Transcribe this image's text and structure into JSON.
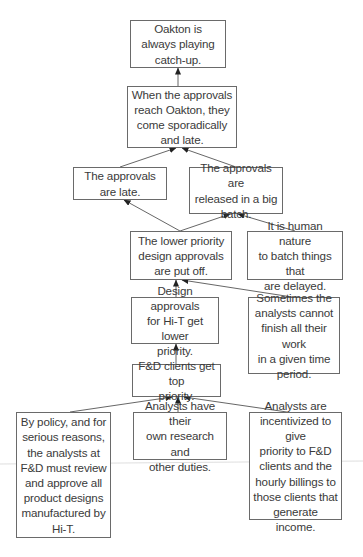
{
  "diagram": {
    "type": "current reality tree",
    "nodes": [
      {
        "id": "n1",
        "text": "Oakton is\nalways playing\ncatch-up.",
        "x": 130,
        "y": 20,
        "w": 96,
        "h": 48
      },
      {
        "id": "n2",
        "text": "When the approvals\nreach Oakton, they\ncome sporadically\nand late.",
        "x": 127,
        "y": 86,
        "w": 110,
        "h": 62
      },
      {
        "id": "n3",
        "text": "The approvals\nare late.",
        "x": 73,
        "y": 167,
        "w": 94,
        "h": 33
      },
      {
        "id": "n4",
        "text": "The approvals are\nreleased in a big\nbatch.",
        "x": 189,
        "y": 167,
        "w": 94,
        "h": 47
      },
      {
        "id": "n5",
        "text": "The lower priority\ndesign approvals\nare put off.",
        "x": 130,
        "y": 231,
        "w": 102,
        "h": 49
      },
      {
        "id": "n6",
        "text": "It is human nature\nto batch  things that\nare delayed.",
        "x": 247,
        "y": 231,
        "w": 96,
        "h": 49
      },
      {
        "id": "n7",
        "text": "Design approvals\nfor Hi-T get lower\npriority.",
        "x": 131,
        "y": 297,
        "w": 88,
        "h": 47
      },
      {
        "id": "n8",
        "text": "Sometimes the\nanalysts cannot\nfinish all their work\nin a given time\nperiod.",
        "x": 248,
        "y": 297,
        "w": 92,
        "h": 77
      },
      {
        "id": "n9",
        "text": "F&D clients get top\npriority.",
        "x": 132,
        "y": 364,
        "w": 89,
        "h": 33
      },
      {
        "id": "n10",
        "text": "By policy, and for\nserious reasons,\nthe analysts at\nF&D must review\nand approve all\nproduct designs\nmanufactured by\nHi-T.",
        "x": 16,
        "y": 412,
        "w": 95,
        "h": 126
      },
      {
        "id": "n11",
        "text": "Analysts have their\nown research and\nother duties.",
        "x": 133,
        "y": 412,
        "w": 94,
        "h": 48
      },
      {
        "id": "n12",
        "text": "Analysts are\nincentivized to give\npriority to F&D\nclients and the\nhourly billings to\nthose clients that\ngenerate income.",
        "x": 249,
        "y": 412,
        "w": 93,
        "h": 108
      }
    ],
    "edges": [
      {
        "from": "n2",
        "to": "n1",
        "x1": 178,
        "y1": 86,
        "x2": 178,
        "y2": 68
      },
      {
        "from": "n3",
        "to": "n2",
        "x1": 120,
        "y1": 167,
        "x2": 176,
        "y2": 148
      },
      {
        "from": "n4",
        "to": "n2",
        "x1": 236,
        "y1": 167,
        "x2": 182,
        "y2": 148
      },
      {
        "from": "n5",
        "to": "n3",
        "x1": 180,
        "y1": 231,
        "x2": 124,
        "y2": 200
      },
      {
        "from": "n5",
        "to": "n4",
        "x1": 180,
        "y1": 231,
        "x2": 230,
        "y2": 214
      },
      {
        "from": "n6",
        "to": "n4",
        "x1": 295,
        "y1": 231,
        "x2": 238,
        "y2": 214
      },
      {
        "from": "n7",
        "to": "n5",
        "x1": 176,
        "y1": 297,
        "x2": 176,
        "y2": 280
      },
      {
        "from": "n8",
        "to": "n5",
        "x1": 292,
        "y1": 297,
        "x2": 182,
        "y2": 280
      },
      {
        "from": "n9",
        "to": "n7",
        "x1": 176,
        "y1": 364,
        "x2": 176,
        "y2": 344
      },
      {
        "from": "n10",
        "to": "n9",
        "x1": 70,
        "y1": 412,
        "x2": 172,
        "y2": 397
      },
      {
        "from": "n11",
        "to": "n9",
        "x1": 178,
        "y1": 412,
        "x2": 178,
        "y2": 397
      },
      {
        "from": "n12",
        "to": "n9",
        "x1": 287,
        "y1": 412,
        "x2": 184,
        "y2": 397
      }
    ],
    "colors": {
      "line": "#555555",
      "border": "#6a6a6a",
      "text": "#3a3a3a",
      "background": "#ffffff",
      "scan_line": "#cfcfcf"
    }
  }
}
